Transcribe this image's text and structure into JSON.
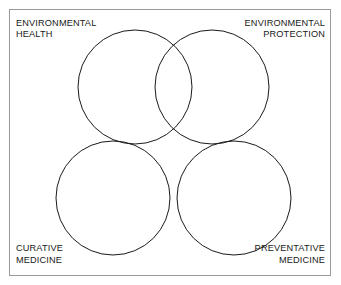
{
  "diagram": {
    "type": "venn-four-circle",
    "title": "",
    "frame": {
      "visible": true,
      "color": "#9a9a9a"
    },
    "background_color": "#ffffff",
    "stroke_color": "#1a1a1a",
    "labels": {
      "top_left": "ENVIRONMENTAL\nHEALTH",
      "top_right": "ENVIRONMENTAL\nPROTECTION",
      "bottom_left": "CURATIVE\nMEDICINE",
      "bottom_right": "PREVENTATIVE\nMEDICINE"
    },
    "circles": [
      {
        "name": "environmental-health",
        "cx": 135,
        "cy": 87,
        "r": 57
      },
      {
        "name": "environmental-protection",
        "cx": 212,
        "cy": 87,
        "r": 57
      },
      {
        "name": "curative-medicine",
        "cx": 113,
        "cy": 198,
        "r": 57
      },
      {
        "name": "preventative-medicine",
        "cx": 234,
        "cy": 198,
        "r": 57
      }
    ]
  }
}
